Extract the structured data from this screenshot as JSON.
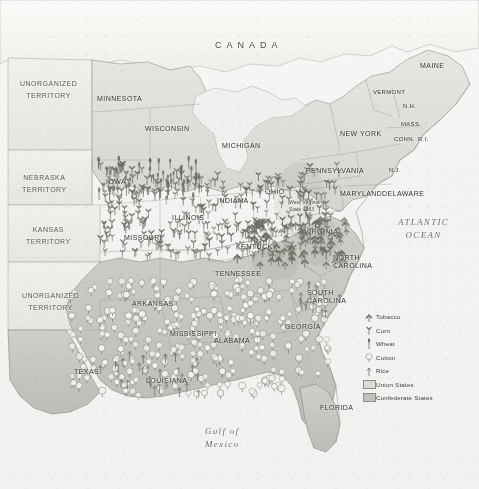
{
  "map": {
    "title": "Civil War Era Agricultural Map of the Eastern United States",
    "country_labels": [
      {
        "name": "CANADA",
        "text": "CANADA",
        "x": 215,
        "y": 40
      }
    ],
    "ocean_labels": [
      {
        "name": "atlantic-ocean-label",
        "text": "ATLANTIC\nOCEAN",
        "x": 398,
        "y": 216
      },
      {
        "name": "gulf-of-mexico-label",
        "text": "Gulf of\nMexico",
        "x": 205,
        "y": 425
      }
    ],
    "annotations": [
      {
        "name": "west-virginia-note",
        "text": "West Virginia\nState 1863",
        "x": 289,
        "y": 199
      }
    ],
    "territories": [
      {
        "name": "unorganized-territory-north",
        "text": "UNORGANIZED\nTERRITORY",
        "x": 20,
        "y": 78
      },
      {
        "name": "nebraska-territory",
        "text": "NEBRASKA\nTERRITORY",
        "x": 22,
        "y": 172
      },
      {
        "name": "kansas-territory",
        "text": "KANSAS\nTERRITORY",
        "x": 26,
        "y": 224
      },
      {
        "name": "unorganized-territory-south",
        "text": "UNORGANIZED\nTERRITORY",
        "x": 22,
        "y": 290
      }
    ],
    "states": [
      {
        "name": "minnesota",
        "text": "MINNESOTA",
        "x": 97,
        "y": 95,
        "size": "md"
      },
      {
        "name": "wisconsin",
        "text": "WISCONSIN",
        "x": 145,
        "y": 125,
        "size": "md"
      },
      {
        "name": "michigan",
        "text": "MICHIGAN",
        "x": 222,
        "y": 142,
        "size": "md"
      },
      {
        "name": "iowa",
        "text": "IOWA",
        "x": 106,
        "y": 178,
        "size": "md"
      },
      {
        "name": "illinois",
        "text": "ILLINOIS",
        "x": 172,
        "y": 214,
        "size": "md"
      },
      {
        "name": "indiana",
        "text": "INDIANA",
        "x": 217,
        "y": 197,
        "size": "md"
      },
      {
        "name": "ohio",
        "text": "OHIO",
        "x": 265,
        "y": 188,
        "size": "md"
      },
      {
        "name": "missouri",
        "text": "MISSOURI",
        "x": 124,
        "y": 234,
        "size": "md"
      },
      {
        "name": "kentucky",
        "text": "KENTUCKY",
        "x": 236,
        "y": 243,
        "size": "md"
      },
      {
        "name": "tennessee",
        "text": "TENNESSEE",
        "x": 215,
        "y": 270,
        "size": "md"
      },
      {
        "name": "arkansas",
        "text": "ARKANSAS",
        "x": 132,
        "y": 300,
        "size": "md"
      },
      {
        "name": "mississippi",
        "text": "MISSISSIPPI",
        "x": 170,
        "y": 330,
        "size": "md"
      },
      {
        "name": "alabama",
        "text": "ALABAMA",
        "x": 214,
        "y": 337,
        "size": "md"
      },
      {
        "name": "georgia",
        "text": "GEORGIA",
        "x": 285,
        "y": 323,
        "size": "md"
      },
      {
        "name": "texas",
        "text": "TEXAS",
        "x": 74,
        "y": 368,
        "size": "md"
      },
      {
        "name": "louisiana",
        "text": "LOUISIANA",
        "x": 146,
        "y": 377,
        "size": "md"
      },
      {
        "name": "florida",
        "text": "FLORIDA",
        "x": 320,
        "y": 404,
        "size": "md"
      },
      {
        "name": "virginia",
        "text": "VIRGINIA",
        "x": 304,
        "y": 228,
        "size": "md"
      },
      {
        "name": "north-carolina",
        "text": "NORTH\nCAROLINA",
        "x": 333,
        "y": 254,
        "size": "md"
      },
      {
        "name": "south-carolina",
        "text": "SOUTH\nCAROLINA",
        "x": 307,
        "y": 289,
        "size": "md"
      },
      {
        "name": "pennsylvania",
        "text": "PENNSYLVANIA",
        "x": 306,
        "y": 167,
        "size": "md"
      },
      {
        "name": "new-york",
        "text": "NEW YORK",
        "x": 340,
        "y": 130,
        "size": "md"
      },
      {
        "name": "maryland",
        "text": "MARYLAND",
        "x": 340,
        "y": 190,
        "size": "md"
      },
      {
        "name": "delaware",
        "text": "DELAWARE",
        "x": 382,
        "y": 190,
        "size": "md"
      },
      {
        "name": "new-jersey",
        "text": "N.J.",
        "x": 389,
        "y": 167,
        "size": "sm"
      },
      {
        "name": "maine",
        "text": "MAINE",
        "x": 420,
        "y": 62,
        "size": "md"
      },
      {
        "name": "vermont",
        "text": "VERMONT",
        "x": 373,
        "y": 89,
        "size": "sm"
      },
      {
        "name": "new-hampshire",
        "text": "N.H.",
        "x": 403,
        "y": 103,
        "size": "sm"
      },
      {
        "name": "massachusetts",
        "text": "MASS.",
        "x": 401,
        "y": 121,
        "size": "sm"
      },
      {
        "name": "connecticut",
        "text": "CONN.",
        "x": 394,
        "y": 136,
        "size": "sm"
      },
      {
        "name": "rhode-island",
        "text": "R.I.",
        "x": 418,
        "y": 136,
        "size": "sm"
      }
    ]
  },
  "legend": {
    "name": "map-legend",
    "items": [
      {
        "name": "legend-tobacco",
        "label": "Tobacco",
        "symbol": "tobacco-icon"
      },
      {
        "name": "legend-corn",
        "label": "Corn",
        "symbol": "corn-icon"
      },
      {
        "name": "legend-wheat",
        "label": "Wheat",
        "symbol": "wheat-icon"
      },
      {
        "name": "legend-cotton",
        "label": "Cotton",
        "symbol": "cotton-icon"
      },
      {
        "name": "legend-rice",
        "label": "Rice",
        "symbol": "rice-icon"
      },
      {
        "name": "legend-union",
        "label": "Union States",
        "symbol": "union-swatch"
      },
      {
        "name": "legend-confederate",
        "label": "Confederate States",
        "symbol": "confederate-swatch"
      }
    ]
  },
  "colors": {
    "union_fill": "#dededa",
    "confederate_fill": "#c9c9c4",
    "territory_fill": "#ebebe7",
    "water": "#f3f3f1",
    "border": "#8d8d88",
    "label_text": "#2f2f2d"
  }
}
